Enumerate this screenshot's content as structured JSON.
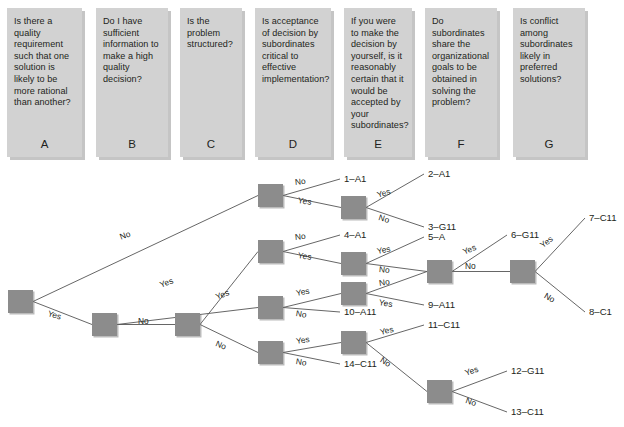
{
  "questions": [
    {
      "letter": "A",
      "text": "Is there a quality requirement such that one solution is likely to be more rational than another?",
      "x": 7,
      "width": 75
    },
    {
      "letter": "B",
      "text": "Do I have sufficient information to make a high quality decision?",
      "x": 96,
      "width": 72
    },
    {
      "letter": "C",
      "text": "Is the problem structured?",
      "x": 180,
      "width": 62
    },
    {
      "letter": "D",
      "text": "Is acceptance of decision by subordinates critical to effective implementation?",
      "x": 255,
      "width": 76
    },
    {
      "letter": "E",
      "text": "If you were to make the decision by yourself, is it reasonably certain that it would be accepted by your subordinates?",
      "x": 344,
      "width": 68
    },
    {
      "letter": "F",
      "text": "Do subordinates share the organizational goals to be obtained in solving the problem?",
      "x": 425,
      "width": 72
    },
    {
      "letter": "G",
      "text": "Is conflict among subordinates likely in preferred solutions?",
      "x": 513,
      "width": 72
    }
  ],
  "tree": {
    "yes_label": "Yes",
    "no_label": "No",
    "nodes": [
      {
        "id": "root",
        "x": 8,
        "y": 122
      },
      {
        "id": "b1",
        "x": 92,
        "y": 145
      },
      {
        "id": "c1",
        "x": 175,
        "y": 145
      },
      {
        "id": "dtop",
        "x": 258,
        "y": 16
      },
      {
        "id": "d2",
        "x": 258,
        "y": 72
      },
      {
        "id": "d3",
        "x": 258,
        "y": 128
      },
      {
        "id": "d4",
        "x": 258,
        "y": 173
      },
      {
        "id": "e1",
        "x": 341,
        "y": 28
      },
      {
        "id": "e2",
        "x": 341,
        "y": 84
      },
      {
        "id": "e3",
        "x": 341,
        "y": 114
      },
      {
        "id": "e4",
        "x": 341,
        "y": 163
      },
      {
        "id": "f1",
        "x": 427,
        "y": 92
      },
      {
        "id": "g1",
        "x": 510,
        "y": 92
      },
      {
        "id": "g2",
        "x": 427,
        "y": 212
      }
    ],
    "edges": [
      {
        "from": "root",
        "to": "dtop",
        "label": "No",
        "lx": 120,
        "ly": 64,
        "rot": -21
      },
      {
        "from": "root",
        "to": "b1",
        "label": "Yes",
        "lx": 48,
        "ly": 140,
        "rot": 16
      },
      {
        "from": "b1",
        "to": "d3",
        "label": "Yes",
        "lx": 160,
        "ly": 112,
        "rot": -21
      },
      {
        "from": "b1",
        "to": "c1",
        "label": "No",
        "lx": 138,
        "ly": 148,
        "rot": 0
      },
      {
        "from": "c1",
        "to": "d2",
        "label": "Yes",
        "lx": 216,
        "ly": 124,
        "rot": -22
      },
      {
        "from": "c1",
        "to": "d4",
        "label": "No",
        "lx": 216,
        "ly": 170,
        "rot": 22
      },
      {
        "from": "dtop",
        "to": "out1",
        "label": "No",
        "lx": 295,
        "ly": 9,
        "rot": -6
      },
      {
        "from": "dtop",
        "to": "e1",
        "label": "Yes",
        "lx": 298,
        "ly": 27,
        "rot": 8
      },
      {
        "from": "e1",
        "to": "out2",
        "label": "Yes",
        "lx": 377,
        "ly": 22,
        "rot": -17
      },
      {
        "from": "e1",
        "to": "out3",
        "label": "No",
        "lx": 379,
        "ly": 44,
        "rot": 17
      },
      {
        "from": "d2",
        "to": "out4",
        "label": "No",
        "lx": 295,
        "ly": 64,
        "rot": -6
      },
      {
        "from": "d2",
        "to": "e2",
        "label": "Yes",
        "lx": 298,
        "ly": 82,
        "rot": 8
      },
      {
        "from": "e2",
        "to": "out5",
        "label": "Yes",
        "lx": 377,
        "ly": 78,
        "rot": -11
      },
      {
        "from": "e2",
        "to": "f1",
        "label": "No",
        "lx": 379,
        "ly": 96,
        "rot": 6
      },
      {
        "from": "d3",
        "to": "e3",
        "label": "Yes",
        "lx": 296,
        "ly": 120,
        "rot": -10
      },
      {
        "from": "d3",
        "to": "out10",
        "label": "No",
        "lx": 296,
        "ly": 140,
        "rot": 9
      },
      {
        "from": "e3",
        "to": "f1",
        "label": "No",
        "lx": 379,
        "ly": 110,
        "rot": -9
      },
      {
        "from": "e3",
        "to": "out9",
        "label": "Yes",
        "lx": 379,
        "ly": 129,
        "rot": 9
      },
      {
        "from": "f1",
        "to": "out6",
        "label": "Yes",
        "lx": 463,
        "ly": 79,
        "rot": -23
      },
      {
        "from": "f1",
        "to": "g1",
        "label": "No",
        "lx": 465,
        "ly": 93,
        "rot": 0
      },
      {
        "from": "g1",
        "to": "out7",
        "label": "Yes",
        "lx": 541,
        "ly": 73,
        "rot": -38
      },
      {
        "from": "g1",
        "to": "out8",
        "label": "No",
        "lx": 545,
        "ly": 122,
        "rot": 30
      },
      {
        "from": "d4",
        "to": "e4",
        "label": "Yes",
        "lx": 296,
        "ly": 168,
        "rot": -9
      },
      {
        "from": "d4",
        "to": "out14",
        "label": "No",
        "lx": 296,
        "ly": 188,
        "rot": 9
      },
      {
        "from": "e4",
        "to": "out11",
        "label": "Yes",
        "lx": 380,
        "ly": 159,
        "rot": -13
      },
      {
        "from": "e4",
        "to": "g2",
        "label": "No",
        "lx": 381,
        "ly": 186,
        "rot": 32
      },
      {
        "from": "g2",
        "to": "out12",
        "label": "Yes",
        "lx": 465,
        "ly": 200,
        "rot": -19
      },
      {
        "from": "g2",
        "to": "out13",
        "label": "No",
        "lx": 466,
        "ly": 227,
        "rot": 19
      }
    ],
    "outcomes": [
      {
        "id": "out1",
        "text": "1–A1",
        "x": 344,
        "y": 5
      },
      {
        "id": "out2",
        "text": "2–A1",
        "x": 428,
        "y": 0
      },
      {
        "id": "out3",
        "text": "3–G11",
        "x": 428,
        "y": 53
      },
      {
        "id": "out4",
        "text": "4–A1",
        "x": 344,
        "y": 61
      },
      {
        "id": "out5",
        "text": "5–A",
        "x": 428,
        "y": 63
      },
      {
        "id": "out6",
        "text": "6–G11",
        "x": 511,
        "y": 61
      },
      {
        "id": "out7",
        "text": "7–C11",
        "x": 589,
        "y": 44
      },
      {
        "id": "out8",
        "text": "8–C1",
        "x": 589,
        "y": 138
      },
      {
        "id": "out9",
        "text": "9–A11",
        "x": 428,
        "y": 131
      },
      {
        "id": "out10",
        "text": "10–A11",
        "x": 344,
        "y": 138
      },
      {
        "id": "out11",
        "text": "11–C11",
        "x": 428,
        "y": 151
      },
      {
        "id": "out12",
        "text": "12–G11",
        "x": 511,
        "y": 197
      },
      {
        "id": "out13",
        "text": "13–C11",
        "x": 511,
        "y": 238
      },
      {
        "id": "out14",
        "text": "14–C11",
        "x": 344,
        "y": 190
      }
    ]
  },
  "colors": {
    "question_box": "#d2d2d2",
    "node": "#8c8c8c",
    "line": "#555555",
    "text": "#231f20",
    "background": "#ffffff"
  }
}
